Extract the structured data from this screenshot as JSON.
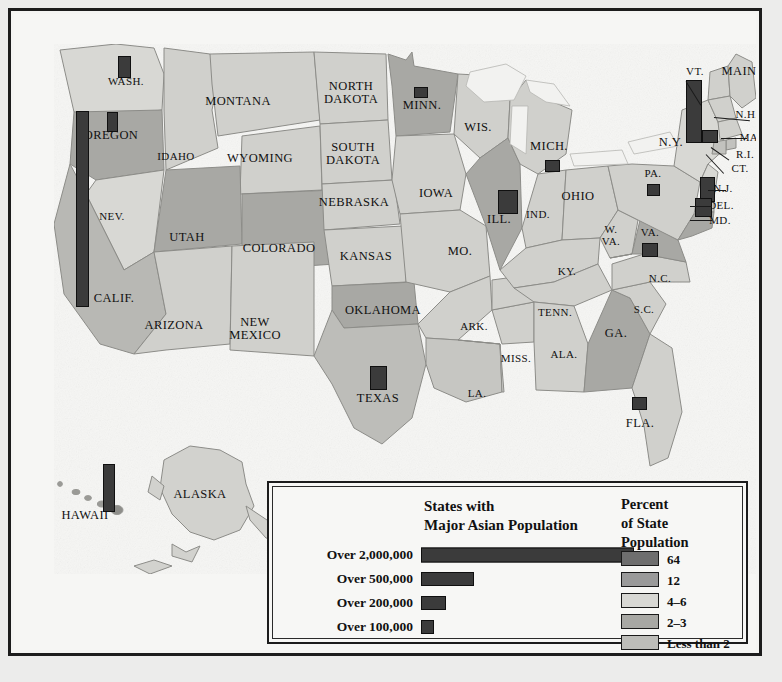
{
  "map": {
    "title": "States with Major Asian Population",
    "state_labels": [
      {
        "name": "WASH.",
        "x": 112,
        "y": 68,
        "size": "sm"
      },
      {
        "name": "OREGON",
        "x": 97,
        "y": 122,
        "size": ""
      },
      {
        "name": "IDAHO",
        "x": 162,
        "y": 143,
        "size": "sm"
      },
      {
        "name": "MONTANA",
        "x": 224,
        "y": 88,
        "size": ""
      },
      {
        "name": "WYOMING",
        "x": 246,
        "y": 145,
        "size": ""
      },
      {
        "name": "NEV.",
        "x": 98,
        "y": 203,
        "size": "sm"
      },
      {
        "name": "UTAH",
        "x": 173,
        "y": 224,
        "size": ""
      },
      {
        "name": "COLORADO",
        "x": 265,
        "y": 235,
        "size": ""
      },
      {
        "name": "CALIF.",
        "x": 100,
        "y": 285,
        "size": ""
      },
      {
        "name": "ARIZONA",
        "x": 160,
        "y": 312,
        "size": ""
      },
      {
        "name": "NEW\nMEXICO",
        "x": 241,
        "y": 315,
        "size": ""
      },
      {
        "name": "NORTH\nDAKOTA",
        "x": 337,
        "y": 79,
        "size": ""
      },
      {
        "name": "SOUTH\nDAKOTA",
        "x": 339,
        "y": 140,
        "size": ""
      },
      {
        "name": "NEBRASKA",
        "x": 340,
        "y": 189,
        "size": ""
      },
      {
        "name": "KANSAS",
        "x": 352,
        "y": 243,
        "size": ""
      },
      {
        "name": "OKLAHOMA",
        "x": 369,
        "y": 297,
        "size": ""
      },
      {
        "name": "TEXAS",
        "x": 364,
        "y": 385,
        "size": ""
      },
      {
        "name": "MINN.",
        "x": 408,
        "y": 92,
        "size": ""
      },
      {
        "name": "IOWA",
        "x": 422,
        "y": 180,
        "size": ""
      },
      {
        "name": "MO.",
        "x": 446,
        "y": 238,
        "size": ""
      },
      {
        "name": "ARK.",
        "x": 460,
        "y": 313,
        "size": "sm"
      },
      {
        "name": "LA.",
        "x": 463,
        "y": 380,
        "size": "sm"
      },
      {
        "name": "WIS.",
        "x": 464,
        "y": 114,
        "size": ""
      },
      {
        "name": "ILL.",
        "x": 485,
        "y": 206,
        "size": ""
      },
      {
        "name": "MISS.",
        "x": 502,
        "y": 345,
        "size": "sm"
      },
      {
        "name": "MICH.",
        "x": 535,
        "y": 133,
        "size": ""
      },
      {
        "name": "IND.",
        "x": 524,
        "y": 201,
        "size": "sm"
      },
      {
        "name": "OHIO",
        "x": 564,
        "y": 183,
        "size": ""
      },
      {
        "name": "KY.",
        "x": 553,
        "y": 258,
        "size": "sm"
      },
      {
        "name": "TENN.",
        "x": 541,
        "y": 299,
        "size": "sm"
      },
      {
        "name": "ALA.",
        "x": 550,
        "y": 341,
        "size": "sm"
      },
      {
        "name": "W.\nVA.",
        "x": 597,
        "y": 222,
        "size": "sm"
      },
      {
        "name": "GA.",
        "x": 602,
        "y": 320,
        "size": ""
      },
      {
        "name": "S.C.",
        "x": 630,
        "y": 296,
        "size": "sm"
      },
      {
        "name": "N.C.",
        "x": 646,
        "y": 265,
        "size": "sm"
      },
      {
        "name": "FLA.",
        "x": 626,
        "y": 410,
        "size": ""
      },
      {
        "name": "VA.",
        "x": 636,
        "y": 219,
        "size": "sm"
      },
      {
        "name": "PA.",
        "x": 639,
        "y": 160,
        "size": "sm"
      },
      {
        "name": "N.Y.",
        "x": 657,
        "y": 129,
        "size": ""
      },
      {
        "name": "VT.",
        "x": 681,
        "y": 58,
        "size": "sm"
      },
      {
        "name": "MAINE",
        "x": 729,
        "y": 58,
        "size": ""
      },
      {
        "name": "N.H.",
        "x": 733,
        "y": 101,
        "size": "sm"
      },
      {
        "name": "MASS.",
        "x": 743,
        "y": 124,
        "size": "sm"
      },
      {
        "name": "R.I.",
        "x": 731,
        "y": 141,
        "size": "sm"
      },
      {
        "name": "CT.",
        "x": 726,
        "y": 155,
        "size": "sm"
      },
      {
        "name": "N.J.",
        "x": 709,
        "y": 175,
        "size": "sm"
      },
      {
        "name": "DEL.",
        "x": 707,
        "y": 192,
        "size": "sm"
      },
      {
        "name": "MD.",
        "x": 706,
        "y": 207,
        "size": "sm"
      },
      {
        "name": "HAWAII",
        "x": 71,
        "y": 502,
        "size": ""
      },
      {
        "name": "ALASKA",
        "x": 186,
        "y": 481,
        "size": ""
      }
    ],
    "markers": [
      {
        "state": "CALIF.",
        "x": 62,
        "y": 97,
        "w": 13,
        "h": 196,
        "tier": "Over 2,000,000"
      },
      {
        "state": "HAWAII",
        "x": 89,
        "y": 450,
        "w": 12,
        "h": 48,
        "tier": "Over 500,000"
      },
      {
        "state": "N.Y.",
        "x": 672,
        "y": 66,
        "w": 16,
        "h": 63,
        "tier": "Over 2,000,000"
      },
      {
        "state": "ILL.",
        "x": 484,
        "y": 176,
        "w": 20,
        "h": 24,
        "tier": "Over 500,000"
      },
      {
        "state": "TEXAS",
        "x": 356,
        "y": 352,
        "w": 17,
        "h": 24,
        "tier": "Over 500,000"
      },
      {
        "state": "N.J.",
        "x": 686,
        "y": 163,
        "w": 15,
        "h": 25,
        "tier": "Over 500,000"
      },
      {
        "state": "WASH.",
        "x": 104,
        "y": 42,
        "w": 13,
        "h": 22,
        "tier": "Over 200,000"
      },
      {
        "state": "OREGON",
        "x": 93,
        "y": 98,
        "w": 11,
        "h": 20,
        "tier": "Over 200,000"
      },
      {
        "state": "DEL.",
        "x": 681,
        "y": 184,
        "w": 17,
        "h": 19,
        "tier": "Over 200,000"
      },
      {
        "state": "VA.",
        "x": 628,
        "y": 229,
        "w": 16,
        "h": 14,
        "tier": "Over 200,000"
      },
      {
        "state": "FLA.",
        "x": 618,
        "y": 383,
        "w": 15,
        "h": 13,
        "tier": "Over 200,000"
      },
      {
        "state": "MASS.",
        "x": 688,
        "y": 116,
        "w": 16,
        "h": 13,
        "tier": "Over 200,000"
      },
      {
        "state": "MICH.",
        "x": 531,
        "y": 146,
        "w": 15,
        "h": 12,
        "tier": "Over 100,000"
      },
      {
        "state": "MINN.",
        "x": 400,
        "y": 73,
        "w": 14,
        "h": 11,
        "tier": "Over 100,000"
      },
      {
        "state": "PA.",
        "x": 633,
        "y": 170,
        "w": 13,
        "h": 12,
        "tier": "Over 100,000"
      }
    ],
    "leaders": [
      {
        "x": 672,
        "y": 67,
        "len": 28,
        "angle": 58
      },
      {
        "x": 700,
        "y": 103,
        "len": 36,
        "angle": 5
      },
      {
        "x": 707,
        "y": 124,
        "len": 26,
        "angle": 0
      },
      {
        "x": 697,
        "y": 133,
        "len": 22,
        "angle": 35
      },
      {
        "x": 692,
        "y": 140,
        "len": 26,
        "angle": 47
      },
      {
        "x": 694,
        "y": 176,
        "len": 18,
        "angle": 0
      },
      {
        "x": 676,
        "y": 192,
        "len": 22,
        "angle": 0
      },
      {
        "x": 676,
        "y": 206,
        "len": 22,
        "angle": 0
      }
    ]
  },
  "legend": {
    "bars_title": "States with\nMajor Asian Population",
    "bars": [
      {
        "label": "Over 2,000,000",
        "width": 213,
        "height": 15
      },
      {
        "label": "Over 500,000",
        "width": 53,
        "height": 14
      },
      {
        "label": "Over 200,000",
        "width": 25,
        "height": 14
      },
      {
        "label": "Over 100,000",
        "width": 13,
        "height": 14
      }
    ],
    "percent_title": "Percent\nof State\nPopulation",
    "percent_items": [
      {
        "label": "64",
        "color": "#6e6e6e"
      },
      {
        "label": "12",
        "color": "#9a9a9a"
      },
      {
        "label": "4–6",
        "color": "#d8d8d4"
      },
      {
        "label": "2–3",
        "color": "#a8a8a4"
      },
      {
        "label": "Less than 2",
        "color": "#bdbdb9"
      }
    ]
  },
  "colors": {
    "bar_fill": "#3b3b3b",
    "frame": "#1c1c1c",
    "paper": "#f6f6f4",
    "tier_64": "#6e6e6e",
    "tier_12": "#9a9a9a",
    "tier_4_6": "#d8d8d4",
    "tier_2_3": "#a8a8a4",
    "tier_lt2": "#bdbdb9"
  },
  "chart_data": {
    "type": "map",
    "legend_title_percent": "Percent of State Population",
    "bar_scale": [
      {
        "tier": "Over 2,000,000",
        "states": [
          "CALIF.",
          "N.Y."
        ]
      },
      {
        "tier": "Over 500,000",
        "states": [
          "HAWAII",
          "ILL.",
          "TEXAS",
          "N.J."
        ]
      },
      {
        "tier": "Over 200,000",
        "states": [
          "WASH.",
          "OREGON",
          "DEL.",
          "VA.",
          "FLA.",
          "MASS."
        ]
      },
      {
        "tier": "Over 100,000",
        "states": [
          "MICH.",
          "MINN.",
          "PA."
        ]
      }
    ],
    "shading_classes": [
      {
        "percent": "64",
        "states": [
          "HAWAII"
        ]
      },
      {
        "percent": "12",
        "states": [
          "CALIF."
        ]
      },
      {
        "percent": "4–6",
        "states": [
          "WASH.",
          "N.Y.",
          "N.J.",
          "NEV."
        ]
      },
      {
        "percent": "2–3",
        "states": [
          "OREGON",
          "UTAH",
          "COLORADO",
          "MINN.",
          "ILL.",
          "TEXAS",
          "OKLAHOMA",
          "GA.",
          "VA.",
          "MD."
        ]
      },
      {
        "percent": "Less than 2",
        "states": [
          "MONTANA",
          "IDAHO",
          "WYOMING",
          "ARIZONA",
          "NEW MEXICO",
          "NORTH DAKOTA",
          "SOUTH DAKOTA",
          "NEBRASKA",
          "KANSAS",
          "IOWA",
          "MO.",
          "ARK.",
          "LA.",
          "WIS.",
          "MISS.",
          "MICH.",
          "IND.",
          "OHIO",
          "KY.",
          "TENN.",
          "ALA.",
          "W. VA.",
          "S.C.",
          "N.C.",
          "FLA.",
          "PA.",
          "MAINE",
          "VT.",
          "N.H.",
          "MASS.",
          "R.I.",
          "CT.",
          "DEL.",
          "ALASKA"
        ]
      }
    ]
  }
}
